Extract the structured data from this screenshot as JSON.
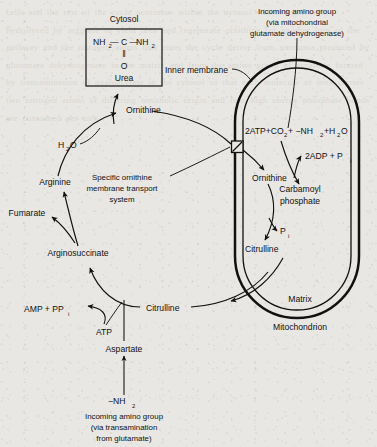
{
  "figure": {
    "background_color": "#e9e7e3",
    "ink_color": "#111111"
  },
  "compartments": {
    "cytosol_label": "Cytosol",
    "mitochondrion_label": "Mitochondrion",
    "matrix_label": "Matrix",
    "inner_membrane_label": "Inner membrane"
  },
  "urea_box": {
    "formula_line1_left": "NH",
    "formula_line1_left_sub": "2",
    "formula_bond1": "— C —",
    "formula_line1_right": "NH",
    "formula_line1_right_sub": "2",
    "double_bond": "‖",
    "oxygen": "O",
    "name": "Urea"
  },
  "metabolites": {
    "ornithine_cytosol": "Ornithine",
    "ornithine_matrix": "Ornithine",
    "arginine": "Arginine",
    "fumarate": "Fumarate",
    "arginosuccinate": "Arginosuccinate",
    "citrulline_cytosol": "Citrulline",
    "citrulline_matrix": "Citrulline",
    "aspartate": "Aspartate",
    "carbamoyl_phosphate_line1": "Carbamoyl",
    "carbamoyl_phosphate_line2": "phosphate"
  },
  "cofactors": {
    "water_main": "H",
    "water_main_sub": "2",
    "water_main_tail": "O",
    "atp": "ATP",
    "amp_ppi": "AMP + PP",
    "amp_ppi_sub": "i",
    "pi_matrix": "P",
    "pi_matrix_sub": "i",
    "adp_pi": "2ADP + P",
    "adp_pi_sub": "i"
  },
  "reaction_equation": {
    "part1": "2ATP+CO",
    "part1_sub": "2",
    "part2": "+ −NH",
    "part2_sub": "2",
    "part3": "+H",
    "part3_sub": "2",
    "part4": "O"
  },
  "annotations": {
    "transport_line1": "Specific ornithine",
    "transport_line2": "membrane transport",
    "transport_line3": "system",
    "amino_top_line1": "Incoming amino group",
    "amino_top_line2": "(via mitochondrial",
    "amino_top_line3": "glutamate dehydrogenase)",
    "amino_bottom_line1": "Incoming amino group",
    "amino_bottom_line2": "(via transamination",
    "amino_bottom_line3": "from glutamate)",
    "amino_group_symbol": "−NH",
    "amino_group_sub": "2"
  },
  "bleed_through_text": "cells and the rest of the cycle continues within the cytosol where arginine is hydrolysed by arginase to yield urea and regenerate ornithine for another turn of the pathway and the nitrogen atoms that enter the cycle derive from ammonia produced by glutamate dehydrogenase in the matrix and from the amino group of aspartate formed by transamination of oxaloacetate in the cytosol so that each molecule of urea carries two nitrogen atoms of differing metabolic origin and four high energy phosphate bonds are consumed per turn"
}
